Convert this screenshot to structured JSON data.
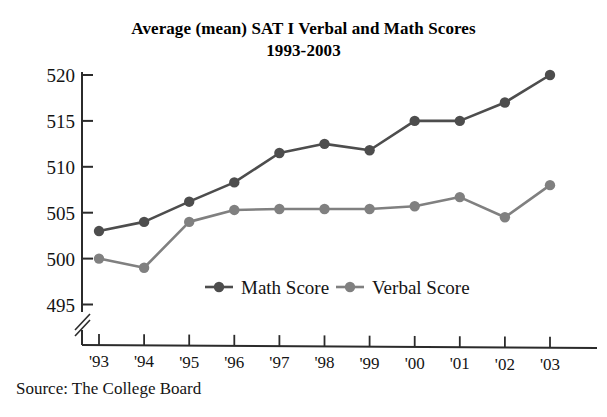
{
  "chart_data": {
    "type": "line",
    "title": "Average (mean) SAT I Verbal and Math Scores",
    "subtitle": "1993-2003",
    "xlabel": "",
    "ylabel": "",
    "categories": [
      "'93",
      "'94",
      "'95",
      "'96",
      "'97",
      "'98",
      "'99",
      "'00",
      "'01",
      "'02",
      "'03"
    ],
    "x": [
      1993,
      1994,
      1995,
      1996,
      1997,
      1998,
      1999,
      2000,
      2001,
      2002,
      2003
    ],
    "series": [
      {
        "name": "Math Score",
        "color": "#4d4d4d",
        "values": [
          503,
          504,
          506.2,
          508.3,
          511.5,
          512.5,
          511.8,
          515,
          515,
          517,
          520
        ]
      },
      {
        "name": "Verbal Score",
        "color": "#808080",
        "values": [
          500,
          499,
          504,
          505.3,
          505.4,
          505.4,
          505.4,
          505.7,
          506.7,
          504.5,
          508
        ]
      }
    ],
    "ylim": [
      495,
      520
    ],
    "yticks": [
      495,
      500,
      505,
      510,
      515,
      520
    ],
    "ytick_labels": [
      "495",
      "500",
      "505",
      "510",
      "515",
      "520"
    ],
    "y_axis_break": true,
    "grid": false,
    "legend_position": "inside-bottom-center",
    "annotations": [
      "Source: The College Board"
    ]
  },
  "source": {
    "note": "Source: The College Board"
  },
  "legend": {
    "items": [
      {
        "label": "Math Score"
      },
      {
        "label": "Verbal Score"
      }
    ]
  },
  "axis": {
    "y_labels": [
      "520",
      "515",
      "510",
      "505",
      "500",
      "495"
    ],
    "x_labels": [
      "'93",
      "'94",
      "'95",
      "'96",
      "'97",
      "'98",
      "'99",
      "'00",
      "'01",
      "'02",
      "'03"
    ]
  },
  "colors": {
    "math": "#4d4d4d",
    "verbal": "#808080",
    "axis": "#2b2b2b",
    "text": "#141414"
  }
}
